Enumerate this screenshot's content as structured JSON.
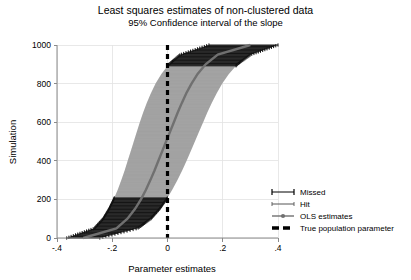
{
  "chart_data": {
    "type": "area",
    "title": "Least squares estimates of non-clustered data",
    "subtitle": "95% Confidence interval of the slope",
    "xlabel": "Parameter estimates",
    "ylabel": "Simulation",
    "xlim": [
      -0.4,
      0.4
    ],
    "ylim": [
      0,
      1000
    ],
    "xticks": [
      -0.4,
      -0.2,
      0,
      0.2,
      0.4
    ],
    "xticklabels": [
      "-.4",
      "-.2",
      "0",
      ".2",
      ".4"
    ],
    "yticks": [
      0,
      200,
      400,
      600,
      800,
      1000
    ],
    "yticklabels": [
      "0",
      "200",
      "400",
      "600",
      "800",
      "1000"
    ],
    "grid": "horizontal",
    "legend_position": "right-middle",
    "true_population_parameter": 0,
    "series": [
      {
        "name": "OLS estimates",
        "type": "line",
        "color": "#707070",
        "points": [
          {
            "y": 0,
            "x": -0.305
          },
          {
            "y": 50,
            "x": -0.185
          },
          {
            "y": 100,
            "x": -0.145
          },
          {
            "y": 150,
            "x": -0.118
          },
          {
            "y": 200,
            "x": -0.096
          },
          {
            "y": 250,
            "x": -0.078
          },
          {
            "y": 300,
            "x": -0.062
          },
          {
            "y": 350,
            "x": -0.047
          },
          {
            "y": 400,
            "x": -0.033
          },
          {
            "y": 450,
            "x": -0.019
          },
          {
            "y": 500,
            "x": -0.005
          },
          {
            "y": 550,
            "x": 0.009
          },
          {
            "y": 600,
            "x": 0.023
          },
          {
            "y": 650,
            "x": 0.037
          },
          {
            "y": 700,
            "x": 0.052
          },
          {
            "y": 750,
            "x": 0.068
          },
          {
            "y": 800,
            "x": 0.087
          },
          {
            "y": 850,
            "x": 0.109
          },
          {
            "y": 900,
            "x": 0.138
          },
          {
            "y": 950,
            "x": 0.182
          },
          {
            "y": 1000,
            "x": 0.3
          }
        ]
      },
      {
        "name": "95% CI lower bound",
        "type": "line",
        "color": "#a8a8a8",
        "points": [
          {
            "y": 0,
            "x": -0.365
          },
          {
            "y": 50,
            "x": -0.265
          },
          {
            "y": 100,
            "x": -0.233
          },
          {
            "y": 150,
            "x": -0.212
          },
          {
            "y": 200,
            "x": -0.195
          },
          {
            "y": 250,
            "x": -0.18
          },
          {
            "y": 300,
            "x": -0.167
          },
          {
            "y": 350,
            "x": -0.155
          },
          {
            "y": 400,
            "x": -0.144
          },
          {
            "y": 450,
            "x": -0.133
          },
          {
            "y": 500,
            "x": -0.122
          },
          {
            "y": 550,
            "x": -0.111
          },
          {
            "y": 600,
            "x": -0.1
          },
          {
            "y": 650,
            "x": -0.088
          },
          {
            "y": 700,
            "x": -0.075
          },
          {
            "y": 750,
            "x": -0.06
          },
          {
            "y": 800,
            "x": -0.043
          },
          {
            "y": 850,
            "x": -0.022
          },
          {
            "y": 900,
            "x": 0.005
          },
          {
            "y": 950,
            "x": 0.046
          },
          {
            "y": 1000,
            "x": 0.15
          }
        ]
      },
      {
        "name": "95% CI upper bound",
        "type": "line",
        "color": "#a8a8a8",
        "points": [
          {
            "y": 0,
            "x": -0.245
          },
          {
            "y": 50,
            "x": -0.108
          },
          {
            "y": 100,
            "x": -0.06
          },
          {
            "y": 150,
            "x": -0.029
          },
          {
            "y": 200,
            "x": -0.004
          },
          {
            "y": 250,
            "x": 0.017
          },
          {
            "y": 300,
            "x": 0.036
          },
          {
            "y": 350,
            "x": 0.053
          },
          {
            "y": 400,
            "x": 0.069
          },
          {
            "y": 450,
            "x": 0.084
          },
          {
            "y": 500,
            "x": 0.099
          },
          {
            "y": 550,
            "x": 0.114
          },
          {
            "y": 600,
            "x": 0.129
          },
          {
            "y": 650,
            "x": 0.144
          },
          {
            "y": 700,
            "x": 0.16
          },
          {
            "y": 750,
            "x": 0.178
          },
          {
            "y": 800,
            "x": 0.198
          },
          {
            "y": 850,
            "x": 0.222
          },
          {
            "y": 900,
            "x": 0.253
          },
          {
            "y": 950,
            "x": 0.301
          },
          {
            "y": 1000,
            "x": 0.4
          }
        ]
      }
    ],
    "legend": [
      {
        "label": "Missed",
        "marker": "capped-whisker",
        "color": "#000000"
      },
      {
        "label": "Hit",
        "marker": "plain-whisker",
        "color": "#555555"
      },
      {
        "label": "OLS estimates",
        "marker": "line-dot",
        "color": "#707070"
      },
      {
        "label": "True population parameter",
        "marker": "thick-dash",
        "color": "#000000"
      }
    ],
    "colors": {
      "ci_band": "#a8a8a8",
      "ols_line": "#707070",
      "reference_line": "#000000",
      "grid": "#e2e2e2",
      "axis": "#8a8a8a"
    }
  }
}
